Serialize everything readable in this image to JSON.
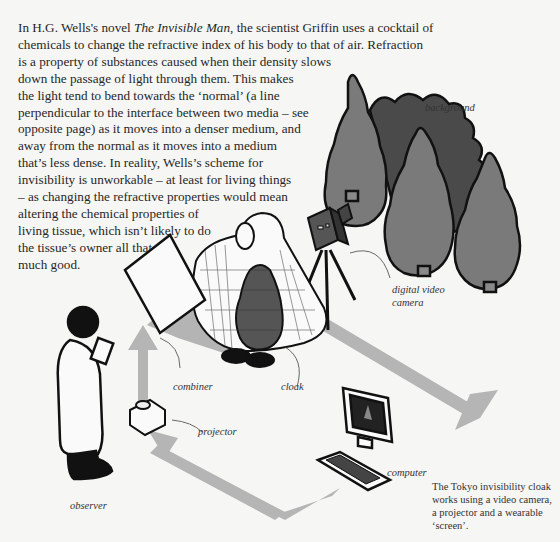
{
  "body_text": {
    "lines": [
      {
        "pre": "In H.G. Wells's novel ",
        "em": "The Invisible Man",
        "post": ", the scientist Griffin uses a cocktail of"
      },
      {
        "pre": "chemicals to change the refractive index of his body to that of air. Refraction"
      },
      {
        "pre": "is a property of substances caused when their density slows"
      },
      {
        "pre": "down the passage of light through them. This makes"
      },
      {
        "pre": "the light tend to bend towards the ‘normal’ (a line"
      },
      {
        "pre": "perpendicular to the interface between two media – see"
      },
      {
        "pre": "opposite page) as it moves into a denser medium, and"
      },
      {
        "pre": "away from the normal as it moves into a medium"
      },
      {
        "pre": "that’s less dense. In reality, Wells’s scheme for"
      },
      {
        "pre": "invisibility is unworkable – at least for living things"
      },
      {
        "pre": "– as changing the refractive properties would mean"
      },
      {
        "pre": "altering the chemical properties of"
      },
      {
        "pre": "living tissue, which isn’t likely to do"
      },
      {
        "pre": "the tissue’s owner all that"
      },
      {
        "pre": "much good."
      }
    ]
  },
  "labels": {
    "background": "background",
    "camera_line1": "digital video",
    "camera_line2": "camera",
    "combiner": "combiner",
    "cloak": "cloak",
    "projector": "projector",
    "computer": "computer",
    "observer": "observer"
  },
  "caption": "The Tokyo invisibility cloak works using a video camera, a projector and a wearable ‘screen’.",
  "colors": {
    "page": "#f6f6f4",
    "tree_light": "#7a7a7a",
    "tree_dark": "#4a4a4a",
    "arrow_grey": "#b5b5b5",
    "outline": "#111111"
  }
}
